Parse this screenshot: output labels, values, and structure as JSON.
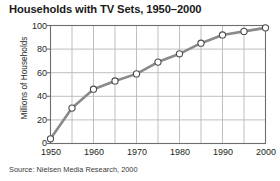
{
  "chart_data": {
    "type": "line",
    "title": "Households with TV Sets, 1950–2000",
    "xlabel": "",
    "ylabel": "Millions of Households",
    "source": "Source: Nielsen Media Research, 2000",
    "x": [
      1950,
      1955,
      1960,
      1965,
      1970,
      1975,
      1980,
      1985,
      1990,
      1995,
      2000
    ],
    "values": [
      4,
      30,
      46,
      53,
      59,
      69,
      76,
      85,
      92,
      95,
      98
    ],
    "series": [
      {
        "name": "Households with TV Sets",
        "values": [
          4,
          30,
          46,
          53,
          59,
          69,
          76,
          85,
          92,
          95,
          98
        ]
      }
    ],
    "xlim": [
      1950,
      2000
    ],
    "ylim": [
      0,
      100
    ],
    "xticks": [
      1950,
      1960,
      1970,
      1980,
      1990,
      2000
    ],
    "xtick_labels": [
      "1950",
      "1960",
      "1970",
      "1980",
      "1990",
      "2000"
    ],
    "yticks": [
      0,
      20,
      40,
      60,
      80,
      100
    ],
    "ytick_labels": [
      "0",
      "20",
      "40",
      "60",
      "80",
      "100"
    ],
    "gridline_x_step": 5,
    "gridline_y_step": 20,
    "grid": true,
    "legend": false,
    "legend_position": "none",
    "line_color": "#8a8a8a",
    "marker_fill": "#ffffff",
    "marker_edge": "#4d4d4d",
    "grid_color": "#b8b8b8",
    "axis_color": "#6e6e6e",
    "text_color": "#231f20"
  }
}
